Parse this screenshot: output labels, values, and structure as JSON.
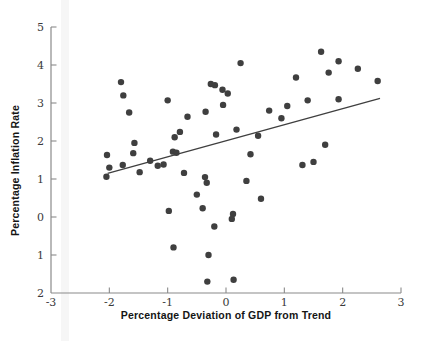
{
  "chart_data": {
    "type": "scatter",
    "title": "",
    "xlabel": "Percentage Deviation of GDP from Trend",
    "ylabel": "Percentage Inflation Rate",
    "xlim": [
      -3,
      3
    ],
    "ylim": [
      -2,
      5
    ],
    "grid": false,
    "legend": "none",
    "x_ticks": [
      {
        "v": -3,
        "label": "-3"
      },
      {
        "v": -2,
        "label": "-2"
      },
      {
        "v": -1,
        "label": "-1"
      },
      {
        "v": 0,
        "label": "0"
      },
      {
        "v": 1,
        "label": "1"
      },
      {
        "v": 2,
        "label": "2"
      },
      {
        "v": 3,
        "label": "3"
      }
    ],
    "y_ticks": [
      {
        "v": 5,
        "label": "5"
      },
      {
        "v": 4,
        "label": "4"
      },
      {
        "v": 3,
        "label": "3"
      },
      {
        "v": 2,
        "label": "2"
      },
      {
        "v": 1,
        "label": "1"
      },
      {
        "v": 0,
        "label": "0"
      },
      {
        "v": -1,
        "label": "1"
      },
      {
        "v": -2,
        "label": "2"
      }
    ],
    "points": [
      [
        -1.8,
        3.55
      ],
      [
        -1.76,
        3.2
      ],
      [
        -1.66,
        2.75
      ],
      [
        -1.0,
        3.07
      ],
      [
        -0.88,
        2.1
      ],
      [
        -0.79,
        2.24
      ],
      [
        -0.66,
        2.64
      ],
      [
        -0.35,
        2.77
      ],
      [
        -0.17,
        2.17
      ],
      [
        -0.26,
        3.5
      ],
      [
        -0.19,
        3.47
      ],
      [
        -0.06,
        3.35
      ],
      [
        0.03,
        3.25
      ],
      [
        -0.05,
        2.95
      ],
      [
        0.18,
        2.3
      ],
      [
        0.25,
        4.05
      ],
      [
        1.63,
        4.35
      ],
      [
        1.93,
        4.1
      ],
      [
        2.26,
        3.9
      ],
      [
        1.76,
        3.8
      ],
      [
        1.2,
        3.67
      ],
      [
        2.6,
        3.58
      ],
      [
        1.4,
        3.07
      ],
      [
        1.93,
        3.1
      ],
      [
        1.05,
        2.92
      ],
      [
        0.74,
        2.8
      ],
      [
        0.95,
        2.6
      ],
      [
        0.55,
        2.14
      ],
      [
        1.7,
        1.9
      ],
      [
        -2.04,
        1.63
      ],
      [
        -2.0,
        1.3
      ],
      [
        -2.05,
        1.06
      ],
      [
        -1.77,
        1.37
      ],
      [
        -1.57,
        1.95
      ],
      [
        -1.59,
        1.68
      ],
      [
        -1.48,
        1.18
      ],
      [
        -1.3,
        1.48
      ],
      [
        -1.17,
        1.35
      ],
      [
        -1.07,
        1.38
      ],
      [
        -0.91,
        1.72
      ],
      [
        -0.85,
        1.69
      ],
      [
        -0.72,
        1.16
      ],
      [
        -0.36,
        1.05
      ],
      [
        -0.33,
        0.9
      ],
      [
        -0.5,
        0.59
      ],
      [
        -0.98,
        0.16
      ],
      [
        -0.4,
        0.23
      ],
      [
        -0.2,
        -0.25
      ],
      [
        -0.9,
        -0.8
      ],
      [
        -0.3,
        -1.0
      ],
      [
        -0.32,
        -1.7
      ],
      [
        0.42,
        1.65
      ],
      [
        1.31,
        1.37
      ],
      [
        1.5,
        1.45
      ],
      [
        0.35,
        0.95
      ],
      [
        0.6,
        0.48
      ],
      [
        0.12,
        0.08
      ],
      [
        0.1,
        -0.05
      ],
      [
        0.13,
        -1.65
      ]
    ],
    "trend_line": {
      "x1": -2.03,
      "y1": 1.15,
      "x2": 2.64,
      "y2": 3.12
    },
    "colors": {
      "point": "#3f3f3f",
      "trend": "#3f3f3f",
      "axis": "#8a8a8a",
      "tick_text": "#3a3a3a"
    }
  }
}
